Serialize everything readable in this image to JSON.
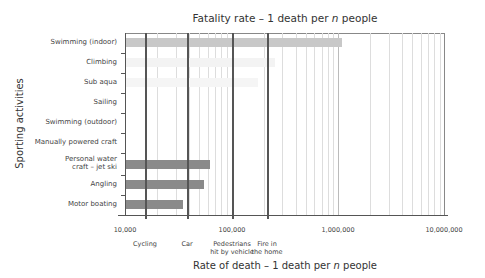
{
  "chart_data": {
    "type": "bar",
    "orientation": "horizontal",
    "title": "Fatality rate – 1 death per n people",
    "xlabel": "Rate of death – 1 death per n people",
    "ylabel": "Sporting activities",
    "xscale": "log",
    "xlim": [
      10000,
      10000000
    ],
    "x_ticks": [
      "10,000",
      "100,000",
      "1,000,000",
      "10,000,000"
    ],
    "categories": [
      "Swimming (indoor)",
      "Climbing",
      "Sub aqua",
      "Sailing",
      "Swimming (outdoor)",
      "Manually powered craft",
      "Personal water craft – jet ski",
      "Angling",
      "Motor boating"
    ],
    "values": [
      1100000,
      250000,
      180000,
      null,
      null,
      null,
      63000,
      55000,
      35000
    ],
    "bar_colors": [
      "#c8c8c8",
      "#f3f3f3",
      "#f5f5f5",
      null,
      null,
      null,
      "#8a8a8a",
      "#8a8a8a",
      "#8a8a8a"
    ],
    "reference_lines": [
      {
        "label": "Cycling",
        "value": 15500
      },
      {
        "label": "Car",
        "value": 38000
      },
      {
        "label": "Pedestrians hit by vehicle",
        "value": 100000
      },
      {
        "label": "Fire in the home",
        "value": 215000
      }
    ],
    "grid": true,
    "legend": null
  },
  "labels": {
    "title_pre": "Fatality rate – 1 death per ",
    "title_n": "n",
    "title_post": " people",
    "xaxis_pre": "Rate of death – 1 death per ",
    "xaxis_n": "n",
    "xaxis_post": " people",
    "yaxis": "Sporting activities",
    "cat0": "Swimming (indoor)",
    "cat1": "Climbing",
    "cat2": "Sub aqua",
    "cat3": "Sailing",
    "cat4": "Swimming (outdoor)",
    "cat5": "Manually powered craft",
    "cat6a": "Personal water",
    "cat6b": "craft – jet ski",
    "cat7": "Angling",
    "cat8": "Motor boating",
    "tick0": "10,000",
    "tick1": "100,000",
    "tick2": "1,000,000",
    "tick3": "10,000,000",
    "ref0": "Cycling",
    "ref1": "Car",
    "ref2a": "Pedestrians",
    "ref2b": "hit by vehicle",
    "ref3a": "Fire in",
    "ref3b": "the home"
  }
}
